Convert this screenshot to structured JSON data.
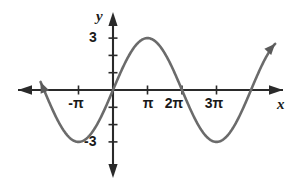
{
  "figure": {
    "kind": "cartesian-graph",
    "width": 301,
    "height": 195,
    "background": "#ffffff",
    "curve_color": "#5a5a5a",
    "axis_color": "#2a2a2a"
  },
  "axes": {
    "x_axis_label": "x",
    "y_axis_label": "y",
    "origin_px": [
      113,
      90
    ],
    "px_per_pi": 34.5,
    "px_per_unit_y": 17.3,
    "x_ticks": [
      {
        "label": "-π",
        "value_pi": -1
      },
      {
        "label": "π",
        "value_pi": 1
      },
      {
        "label": "2π",
        "value_pi": 2
      },
      {
        "label": "3π",
        "value_pi": 3
      }
    ],
    "y_ticks": [
      {
        "label": "3",
        "value": 3
      },
      {
        "label": "-3",
        "value": -3
      }
    ],
    "untitled_y_ticks": [
      2,
      1,
      -1,
      -2
    ],
    "arrowheads": [
      "left",
      "right",
      "up",
      "down"
    ]
  },
  "chart_data": {
    "type": "line",
    "title": "",
    "xlabel": "x",
    "ylabel": "y",
    "grid": false,
    "legend": null,
    "function": "y = 3 sin(x/2)",
    "amplitude": 3,
    "period_pi": 4,
    "xlim_pi": [
      -2.1,
      4.7
    ],
    "ylim": [
      -4.5,
      4.5
    ],
    "x_tick_labels": [
      "-π",
      "π",
      "2π",
      "3π"
    ],
    "y_tick_labels": [
      "3",
      "-3"
    ],
    "key_points": [
      {
        "x_pi": -2,
        "y": 0,
        "note": "zero crossing ascending"
      },
      {
        "x_pi": -1,
        "y": -3,
        "note": "minimum"
      },
      {
        "x_pi": 0,
        "y": 0,
        "note": "origin, ascending"
      },
      {
        "x_pi": 1,
        "y": 3,
        "note": "maximum"
      },
      {
        "x_pi": 2,
        "y": 0,
        "note": "zero crossing descending"
      },
      {
        "x_pi": 3,
        "y": -3,
        "note": "minimum"
      },
      {
        "x_pi": 4,
        "y": 0,
        "note": "zero crossing ascending"
      }
    ],
    "series": [
      {
        "name": "y = 3 sin(x/2)",
        "x_pi": [
          -2.1,
          -2.0,
          -1.8,
          -1.6,
          -1.4,
          -1.2,
          -1.0,
          -0.8,
          -0.6,
          -0.4,
          -0.2,
          0.0,
          0.2,
          0.4,
          0.6,
          0.8,
          1.0,
          1.2,
          1.4,
          1.6,
          1.8,
          2.0,
          2.2,
          2.4,
          2.6,
          2.8,
          3.0,
          3.2,
          3.4,
          3.6,
          3.8,
          4.0,
          4.2,
          4.4,
          4.6
        ],
        "values": [
          0.47,
          0.0,
          -0.93,
          -1.76,
          -2.43,
          -2.85,
          -3.0,
          -2.85,
          -2.43,
          -1.76,
          -0.93,
          0.0,
          0.93,
          1.76,
          2.43,
          2.85,
          3.0,
          2.85,
          2.43,
          1.76,
          0.93,
          0.0,
          -0.93,
          -1.76,
          -2.43,
          -2.85,
          -3.0,
          -2.85,
          -2.43,
          -1.76,
          -0.93,
          0.0,
          0.93,
          1.76,
          2.43
        ]
      }
    ]
  }
}
